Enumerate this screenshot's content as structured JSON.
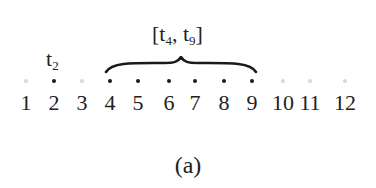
{
  "points": [
    {
      "label": "1",
      "x": 26,
      "selected": false
    },
    {
      "label": "2",
      "x": 54,
      "selected": true
    },
    {
      "label": "3",
      "x": 82,
      "selected": false
    },
    {
      "label": "4",
      "x": 110,
      "selected": true
    },
    {
      "label": "5",
      "x": 138,
      "selected": true
    },
    {
      "label": "6",
      "x": 169,
      "selected": true
    },
    {
      "label": "7",
      "x": 195,
      "selected": true
    },
    {
      "label": "8",
      "x": 224,
      "selected": true
    },
    {
      "label": "9",
      "x": 252,
      "selected": true
    },
    {
      "label": "10",
      "x": 283,
      "selected": false
    },
    {
      "label": "11",
      "x": 310,
      "selected": false
    },
    {
      "label": "12",
      "x": 345,
      "selected": false
    }
  ],
  "point_label": {
    "base": "t",
    "sub": "2"
  },
  "interval_label": {
    "open": "[",
    "t1": "t",
    "s1": "4",
    "sep": ", ",
    "t2": "t",
    "s2": "9",
    "close": "]"
  },
  "caption": "(a)"
}
